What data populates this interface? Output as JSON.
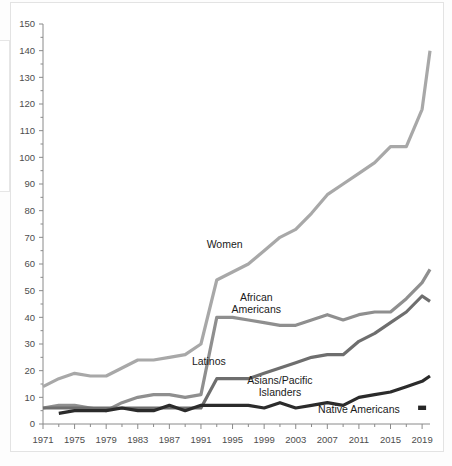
{
  "chart_data": {
    "type": "line",
    "title": "",
    "subtitle": "",
    "xlabel": "",
    "ylabel": "",
    "xlim": [
      1971,
      2020
    ],
    "ylim": [
      0,
      150
    ],
    "grid": false,
    "legend_position": "inline-labels",
    "y_ticks": [
      0,
      10,
      20,
      30,
      40,
      50,
      60,
      70,
      80,
      90,
      100,
      110,
      120,
      130,
      140,
      150
    ],
    "y_tick_labels": [
      "0",
      "10",
      "20",
      "30",
      "40",
      "50",
      "60",
      "70",
      "80",
      "90",
      "100",
      "110",
      "120",
      "130",
      "140",
      "150"
    ],
    "x_ticks": [
      1971,
      1975,
      1979,
      1983,
      1987,
      1991,
      1995,
      1999,
      2003,
      2007,
      2011,
      2015,
      2019
    ],
    "x_tick_labels": [
      "1971",
      "1975",
      "1979",
      "1983",
      "1987",
      "1991",
      "1995",
      "1999",
      "2003",
      "2007",
      "2011",
      "2015",
      "2019"
    ],
    "x_minor_tick_step": 2,
    "series": [
      {
        "name": "Women",
        "label": "Women",
        "color": "#a8a8a8",
        "stroke_width": 3.2,
        "label_x": 1994,
        "label_y": 66,
        "x": [
          1971,
          1973,
          1975,
          1977,
          1979,
          1981,
          1983,
          1985,
          1987,
          1989,
          1991,
          1993,
          1995,
          1997,
          1999,
          2001,
          2003,
          2005,
          2007,
          2009,
          2011,
          2013,
          2015,
          2017,
          2019,
          2020
        ],
        "values": [
          14,
          17,
          19,
          18,
          18,
          21,
          24,
          24,
          25,
          26,
          30,
          54,
          57,
          60,
          65,
          70,
          73,
          79,
          86,
          90,
          94,
          98,
          104,
          104,
          118,
          140
        ]
      },
      {
        "name": "African Americans",
        "label": "African\nAmericans",
        "color": "#8f8f8f",
        "stroke_width": 3.2,
        "label_x": 1998,
        "label_y": 46,
        "x": [
          1971,
          1973,
          1975,
          1977,
          1979,
          1981,
          1983,
          1985,
          1987,
          1989,
          1991,
          1993,
          1995,
          1997,
          1999,
          2001,
          2003,
          2005,
          2007,
          2009,
          2011,
          2013,
          2015,
          2017,
          2019,
          2020
        ],
        "values": [
          6,
          7,
          7,
          6,
          5,
          8,
          10,
          11,
          11,
          10,
          11,
          40,
          40,
          39,
          38,
          37,
          37,
          39,
          41,
          39,
          41,
          42,
          42,
          47,
          53,
          58
        ]
      },
      {
        "name": "Latinos",
        "label": "Latinos",
        "color": "#6e6e6e",
        "stroke_width": 3.2,
        "label_x": 1992,
        "label_y": 22,
        "x": [
          1971,
          1973,
          1975,
          1977,
          1979,
          1981,
          1983,
          1985,
          1987,
          1989,
          1991,
          1993,
          1995,
          1997,
          1999,
          2001,
          2003,
          2005,
          2007,
          2009,
          2011,
          2013,
          2015,
          2017,
          2019,
          2020
        ],
        "values": [
          6,
          6,
          6,
          6,
          6,
          6,
          6,
          6,
          6,
          6,
          6,
          17,
          17,
          17,
          19,
          21,
          23,
          25,
          26,
          26,
          31,
          34,
          38,
          42,
          48,
          46
        ]
      },
      {
        "name": "Asians/Pacific Islanders",
        "label": "Asians/Pacific\nIslanders",
        "color": "#2b2b2b",
        "stroke_width": 3.2,
        "label_x": 2001,
        "label_y": 15,
        "x": [
          1973,
          1975,
          1977,
          1979,
          1981,
          1983,
          1985,
          1987,
          1989,
          1991,
          1993,
          1995,
          1997,
          1999,
          2001,
          2003,
          2005,
          2007,
          2009,
          2011,
          2013,
          2015,
          2017,
          2019,
          2020
        ],
        "values": [
          4,
          5,
          5,
          5,
          6,
          5,
          5,
          7,
          5,
          7,
          7,
          7,
          7,
          6,
          8,
          6,
          7,
          8,
          7,
          10,
          11,
          12,
          14,
          16,
          18
        ]
      },
      {
        "name": "Native Americans",
        "label": "Native Americans",
        "color": "#262626",
        "stroke_width": 2.4,
        "label_x": 2011,
        "label_y": 4,
        "marker": true,
        "marker_x": 2019,
        "marker_y": 6,
        "x": [
          1971,
          2020
        ],
        "values": [
          0,
          0
        ]
      }
    ]
  }
}
